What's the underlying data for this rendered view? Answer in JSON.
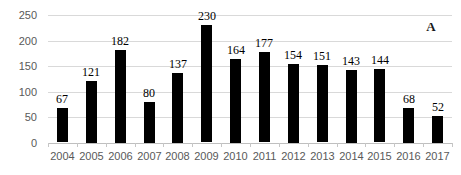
{
  "chart_data": {
    "type": "bar",
    "title": "",
    "xlabel": "",
    "ylabel": "",
    "categories": [
      "2004",
      "2005",
      "2006",
      "2007",
      "2008",
      "2009",
      "2010",
      "2011",
      "2012",
      "2013",
      "2014",
      "2015",
      "2016",
      "2017"
    ],
    "values": [
      67,
      121,
      182,
      80,
      137,
      230,
      164,
      177,
      154,
      151,
      143,
      144,
      68,
      52
    ],
    "value_labels_shown": true,
    "ylim": [
      0,
      250
    ],
    "yticks": [
      0,
      50,
      100,
      150,
      200,
      250
    ],
    "grid": "horizontal",
    "legend": "none",
    "annotation": "A",
    "colors": {
      "bar": "#000000",
      "gridline": "#d9d9d9",
      "axis_line": "#bfbfbf",
      "axis_labels": "#595959",
      "value_labels": "#000000",
      "background": "#ffffff"
    }
  }
}
